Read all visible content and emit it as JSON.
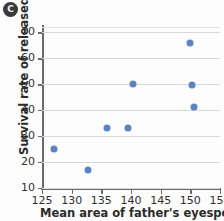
{
  "panel": {
    "badge_label": "C"
  },
  "chart_data": {
    "type": "scatter",
    "title": "",
    "xlabel": "Mean area of father's eyespot (mm²)",
    "ylabel": "Survival rate of released chicks (%)",
    "xlim": [
      125,
      155
    ],
    "ylim": [
      10,
      72
    ],
    "xticks": [
      125,
      130,
      135,
      140,
      145,
      150,
      155
    ],
    "yticks": [
      10,
      20,
      30,
      40,
      50,
      60,
      70
    ],
    "grid": "horizontal",
    "legend": "none",
    "point_color": "#5b84c4",
    "series": [
      {
        "name": "chick survival",
        "points": [
          {
            "x": 127.0,
            "y": 25.0
          },
          {
            "x": 132.7,
            "y": 16.8
          },
          {
            "x": 136.0,
            "y": 33.0
          },
          {
            "x": 139.5,
            "y": 33.0
          },
          {
            "x": 140.3,
            "y": 50.0
          },
          {
            "x": 150.0,
            "y": 66.0
          },
          {
            "x": 150.3,
            "y": 49.7
          },
          {
            "x": 150.6,
            "y": 41.2
          }
        ]
      }
    ]
  }
}
